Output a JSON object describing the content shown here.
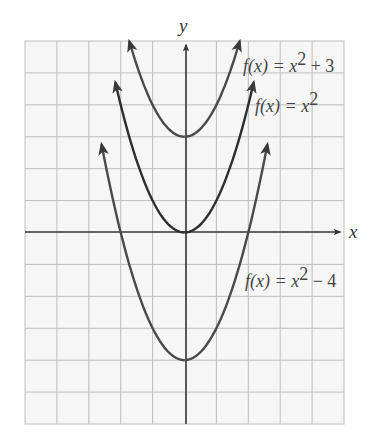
{
  "chart_data": {
    "type": "line",
    "title": "",
    "xlabel": "x",
    "ylabel": "y",
    "xlim": [
      -5,
      5
    ],
    "ylim": [
      -6,
      6
    ],
    "grid": true,
    "grid_step": 1,
    "tick_labels_shown": false,
    "series": [
      {
        "name": "f(x) = x^2 + 3",
        "label": {
          "prefix": "f(x) = x",
          "sup": "2",
          "suffix": " + 3"
        },
        "shift": 3,
        "x_range": [
          -1.73,
          1.73
        ],
        "vertex": [
          0,
          3
        ],
        "points": [
          [
            -1.73,
            6
          ],
          [
            -1,
            4
          ],
          [
            0,
            3
          ],
          [
            1,
            4
          ],
          [
            1.73,
            6
          ]
        ],
        "color": "#4a4a4a"
      },
      {
        "name": "f(x) = x^2",
        "label": {
          "prefix": "f(x) = x",
          "sup": "2",
          "suffix": ""
        },
        "shift": 0,
        "x_range": [
          -2.17,
          2.17
        ],
        "vertex": [
          0,
          0
        ],
        "points": [
          [
            -2.17,
            4.7
          ],
          [
            -2,
            4
          ],
          [
            -1,
            1
          ],
          [
            0,
            0
          ],
          [
            1,
            1
          ],
          [
            2,
            4
          ],
          [
            2.17,
            4.7
          ]
        ],
        "color": "#2e2e2e"
      },
      {
        "name": "f(x) = x^2 - 4",
        "label": {
          "prefix": "f(x) = x",
          "sup": "2",
          "suffix": " − 4"
        },
        "shift": -4,
        "x_range": [
          -2.6,
          2.6
        ],
        "vertex": [
          0,
          -4
        ],
        "points": [
          [
            -2.6,
            2.8
          ],
          [
            -2,
            0
          ],
          [
            -1,
            -3
          ],
          [
            0,
            -4
          ],
          [
            1,
            -3
          ],
          [
            2,
            0
          ],
          [
            2.6,
            2.8
          ]
        ],
        "color": "#4a4a4a"
      }
    ],
    "legend": "inline labels near curves (upper right)"
  },
  "colors": {
    "grid": "#bdbdbd",
    "plot_bg": "#f6f6f6",
    "axis": "#333333",
    "text": "#444444"
  }
}
